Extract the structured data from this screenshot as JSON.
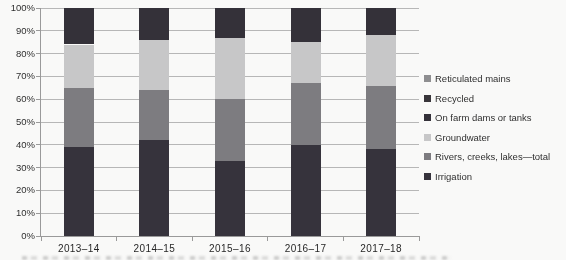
{
  "chart_data": {
    "type": "bar",
    "stacked": true,
    "title": "",
    "xlabel": "",
    "ylabel": "",
    "ylim": [
      0,
      100
    ],
    "grid": true,
    "legend_position": "right",
    "y_tick_labels": [
      "0%",
      "10%",
      "20%",
      "30%",
      "40%",
      "50%",
      "60%",
      "70%",
      "80%",
      "90%",
      "100%"
    ],
    "categories": [
      "2013–14",
      "2014–15",
      "2015–16",
      "2016–17",
      "2017–18"
    ],
    "series": [
      {
        "name": "Irrigation",
        "color": "#34313a",
        "values": [
          39,
          42,
          33,
          40,
          38
        ]
      },
      {
        "name": "Rivers, creeks, lakes—total",
        "color": "#7d7c80",
        "values": [
          26,
          22,
          27,
          27,
          28
        ]
      },
      {
        "name": "Groundwater",
        "color": "#c9c9ca",
        "values": [
          19,
          22,
          27,
          18,
          22
        ]
      },
      {
        "name": "On farm dams or tanks",
        "color": "#322f37",
        "values": [
          16,
          14,
          13,
          15,
          12
        ]
      },
      {
        "name": "Recycled",
        "color": "#363338",
        "values": [
          0,
          0,
          0,
          0,
          0
        ]
      },
      {
        "name": "Reticulated mains",
        "color": "#8e8e90",
        "values": [
          0,
          0,
          0,
          0,
          0
        ]
      }
    ],
    "legend_order": [
      "Reticulated mains",
      "Recycled",
      "On farm dams or tanks",
      "Groundwater",
      "Rivers, creeks, lakes—total",
      "Irrigation"
    ],
    "annotations": "Grayscale scanned chart; Recycled and Reticulated mains segments are not visually resolvable — top dark block read as On farm dams or tanks.",
    "colors": {
      "gridline": "#b9b9b9",
      "axis": "#9b9b9b",
      "text": "#2d2d2d",
      "background": "#fdfdfc"
    }
  }
}
